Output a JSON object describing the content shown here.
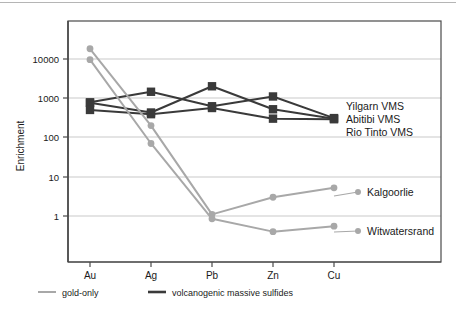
{
  "chart_data": {
    "type": "line",
    "title": "",
    "xlabel": "",
    "ylabel": "Enrichment",
    "categories": [
      "Au",
      "Ag",
      "Pb",
      "Zn",
      "Cu"
    ],
    "yscale": "log",
    "ylim": [
      0.25,
      60000
    ],
    "yticks": [
      1,
      10,
      100,
      1000,
      10000
    ],
    "ytick_labels": [
      "1",
      "10",
      "100",
      "1000",
      "10000"
    ],
    "grid": "horizontal",
    "legend_position": "below-axis",
    "series": [
      {
        "name": "Yilgarn VMS",
        "group": "volcanogenic massive sulfides",
        "color": "#3a3a3a",
        "marker": "square",
        "values": [
          780,
          1450,
          620,
          1100,
          310
        ],
        "annotation": "Yilgarn VMS"
      },
      {
        "name": "Abitibi VMS",
        "group": "volcanogenic massive sulfides",
        "color": "#3a3a3a",
        "marker": "square",
        "values": [
          760,
          430,
          2000,
          520,
          300
        ],
        "annotation": "Abitibi VMS"
      },
      {
        "name": "Rio Tinto VMS",
        "group": "volcanogenic massive sulfides",
        "color": "#3a3a3a",
        "marker": "square",
        "values": [
          500,
          390,
          560,
          300,
          290
        ],
        "annotation": "Rio Tinto VMS"
      },
      {
        "name": "Kalgoorlie",
        "group": "gold-only",
        "color": "#a8a8a8",
        "marker": "circle",
        "values": [
          18000,
          200,
          1.1,
          3.0,
          5.2
        ],
        "annotation": "Kalgoorlie"
      },
      {
        "name": "Witwatersrand",
        "group": "gold-only",
        "color": "#a8a8a8",
        "marker": "circle",
        "values": [
          9500,
          70,
          0.85,
          0.4,
          0.55
        ],
        "annotation": "Witwatersrand"
      }
    ],
    "annotations": [
      {
        "label": "Yilgarn VMS",
        "x": 346,
        "y": 106
      },
      {
        "label": "Abitibi VMS",
        "x": 346,
        "y": 118
      },
      {
        "label": "Rio Tinto VMS",
        "x": 346,
        "y": 130
      },
      {
        "label": "Kalgoorlie",
        "x": 378,
        "y": 196
      },
      {
        "label": "Witwatersrand",
        "x": 378,
        "y": 235
      }
    ],
    "legend": [
      {
        "label": "gold-only",
        "color": "#a8a8a8"
      },
      {
        "label": "volcanogenic massive sulfides",
        "color": "#3a3a3a"
      }
    ]
  },
  "colors": {
    "gold_only": "#a8a8a8",
    "vms": "#3a3a3a",
    "grid": "#c9c9c9",
    "axis": "#4a4a4a",
    "text": "#1a1a1a",
    "background": "#ffffff"
  }
}
